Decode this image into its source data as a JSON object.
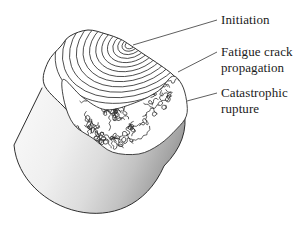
{
  "figure": {
    "annotations": {
      "initiation": {
        "label": "Initiation"
      },
      "fatigue_propagation": {
        "line1": "Fatigue crack",
        "line2": "propagation"
      },
      "catastrophic_rupture": {
        "line1": "Catastrophic",
        "line2": "rupture"
      }
    }
  },
  "colors": {
    "background": "#ffffff",
    "ink": "#2f2f2f",
    "texture_line": "#2a2a2a",
    "leader_line": "#4d4d4d",
    "label_text": "#1b1b1b",
    "face_fill": "#ffffff",
    "body_gradient": [
      "#dcdcdc",
      "#f6f6f6",
      "#efefef",
      "#dcdcdc",
      "#c2c2c2",
      "#a5a5a5",
      "#8b8b8b",
      "#989898"
    ]
  }
}
